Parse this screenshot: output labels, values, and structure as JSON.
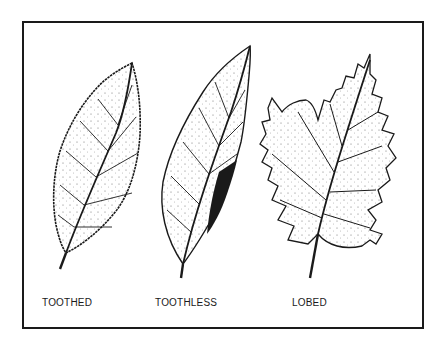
{
  "figure": {
    "labels": {
      "toothed": "TOOTHED",
      "toothless": "TOOTHLESS",
      "lobed": "LOBED"
    },
    "items": [
      {
        "name": "toothed-leaf",
        "label": "TOOTHED"
      },
      {
        "name": "toothless-leaf",
        "label": "TOOTHLESS"
      },
      {
        "name": "lobed-leaf",
        "label": "LOBED"
      }
    ],
    "colors": {
      "ink": "#1a1a1a",
      "paper": "#ffffff"
    }
  }
}
